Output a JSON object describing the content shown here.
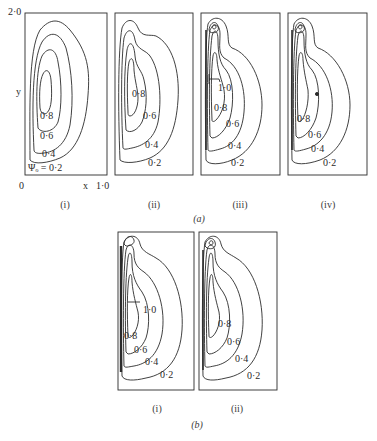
{
  "figure": {
    "part_a": {
      "label": "(a)",
      "axes": {
        "y_top": "2·0",
        "y_label": "y",
        "x_origin": "0",
        "x_label": "x",
        "x_end": "1·0"
      },
      "panels": [
        {
          "id": "i",
          "label": "(i)",
          "contour_labels": [
            "0·8",
            "0·6",
            "0·4",
            "Ψₒ = 0·2"
          ]
        },
        {
          "id": "ii",
          "label": "(ii)",
          "contour_labels": [
            "0·8",
            "0·6",
            "0·4",
            "0·2"
          ]
        },
        {
          "id": "iii",
          "label": "(iii)",
          "contour_labels": [
            "1·0",
            "0·8",
            "0·6",
            "0·4",
            "0·2"
          ]
        },
        {
          "id": "iv",
          "label": "(iv)",
          "contour_labels": [
            "0·8",
            "0·6",
            "0·4",
            "0·2"
          ]
        }
      ]
    },
    "part_b": {
      "label": "(b)",
      "panels": [
        {
          "id": "i",
          "label": "(i)",
          "contour_labels": [
            "1·0",
            "0·8",
            "0·6",
            "0·4",
            "0·2"
          ]
        },
        {
          "id": "ii",
          "label": "(ii)",
          "contour_labels": [
            "0·8",
            "0·6",
            "0·4",
            "0·2"
          ]
        }
      ]
    },
    "caption": ""
  },
  "colors": {
    "line": "#2b2b2b",
    "background": "#ffffff"
  }
}
